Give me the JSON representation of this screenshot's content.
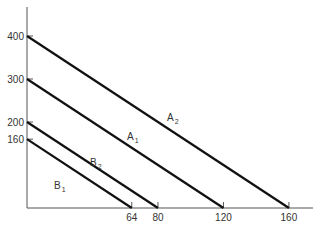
{
  "chart_data": {
    "type": "line",
    "title": "",
    "xlabel": "",
    "ylabel": "",
    "xlim": [
      0,
      175
    ],
    "ylim": [
      0,
      460
    ],
    "grid": false,
    "legend": "inline labels on lines",
    "x_ticks": [
      64,
      80,
      120,
      160
    ],
    "y_ticks": [
      160,
      200,
      300,
      400
    ],
    "series": [
      {
        "name": "A2",
        "base": "A",
        "sub": "2",
        "points": [
          [
            0,
            400
          ],
          [
            160,
            0
          ]
        ],
        "label_pos": [
          167,
          121
        ]
      },
      {
        "name": "A1",
        "base": "A",
        "sub": "1",
        "points": [
          [
            0,
            300
          ],
          [
            120,
            0
          ]
        ],
        "label_pos": [
          127,
          140
        ]
      },
      {
        "name": "B2",
        "base": "B",
        "sub": "2",
        "points": [
          [
            0,
            200
          ],
          [
            80,
            0
          ]
        ],
        "label_pos": [
          90,
          166
        ]
      },
      {
        "name": "B1",
        "base": "B",
        "sub": "1",
        "points": [
          [
            0,
            160
          ],
          [
            64,
            0
          ]
        ],
        "label_pos": [
          54,
          189
        ]
      }
    ]
  },
  "layout": {
    "axis_color": "#555555",
    "line_color": "#111111",
    "origin_px": [
      27,
      208
    ],
    "x_scale_px_per_unit": 1.637,
    "y_scale_px_per_unit": 0.43,
    "y_axis_top_px": 7,
    "x_axis_right_px": 313
  }
}
